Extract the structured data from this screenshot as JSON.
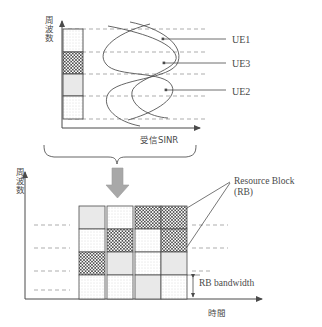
{
  "figure": {
    "title_semantic": "frequency-selective-scheduling-diagram"
  },
  "top_chart": {
    "yaxis_label": "周波数",
    "xaxis_label": "受信SINR",
    "ue_labels": [
      {
        "name": "UE1",
        "text": "UE1"
      },
      {
        "name": "UE3",
        "text": "UE3"
      },
      {
        "name": "UE2",
        "text": "UE2"
      }
    ],
    "bar_segments": [
      {
        "pattern": "dotted",
        "label": "segment-1-dotted"
      },
      {
        "pattern": "checker",
        "label": "segment-2-checker"
      },
      {
        "pattern": "gray",
        "label": "segment-3-gray"
      },
      {
        "pattern": "dotted",
        "label": "segment-4-dotted"
      }
    ]
  },
  "bottom_chart": {
    "yaxis_label": "周波数",
    "xaxis_label": "時間",
    "callout_line1": "Resource Block",
    "callout_line2": "(RB)",
    "bandwidth_label": "RB bandwidth",
    "grid": {
      "columns": 4,
      "rows": 4,
      "cells": [
        [
          "gray",
          "dotted",
          "checker",
          "checker"
        ],
        [
          "dotted",
          "checker",
          "dotted",
          "checker"
        ],
        [
          "checker",
          "gray",
          "dotted",
          "gray"
        ],
        [
          "dotted",
          "dotted",
          "gray",
          "dotted"
        ]
      ]
    }
  },
  "colors": {
    "stroke": "#4a4a4a",
    "arrow_gray": "#a8a8a8",
    "gray_fill": "#e6e6e6",
    "dash": "#7d7d7d"
  }
}
